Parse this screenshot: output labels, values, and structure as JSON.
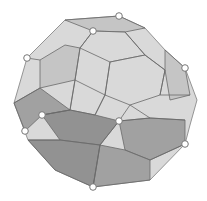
{
  "figure": {
    "colors": {
      "background": "#ffffff",
      "light_face": "#d9d9d9",
      "mid_face": "#b5b5b5",
      "dark_face": "#8e8e8e",
      "darker_face": "#7a7a7a",
      "edge": "#6a6a6a",
      "vertex_marker": "#ffffff"
    },
    "hull": [
      [
        65,
        20
      ],
      [
        119,
        16
      ],
      [
        145,
        28
      ],
      [
        165,
        50
      ],
      [
        185,
        68
      ],
      [
        197,
        100
      ],
      [
        190,
        125
      ],
      [
        185,
        144
      ],
      [
        150,
        180
      ],
      [
        93,
        187
      ],
      [
        55,
        170
      ],
      [
        28,
        140
      ],
      [
        14,
        103
      ],
      [
        27,
        58
      ]
    ],
    "upper_faces": [
      [
        [
          65,
          20
        ],
        [
          119,
          16
        ],
        [
          145,
          28
        ],
        [
          125,
          32
        ],
        [
          93,
          31
        ]
      ],
      [
        [
          93,
          31
        ],
        [
          125,
          32
        ],
        [
          145,
          55
        ],
        [
          110,
          62
        ],
        [
          80,
          48
        ]
      ],
      [
        [
          40,
          60
        ],
        [
          65,
          45
        ],
        [
          80,
          48
        ],
        [
          75,
          80
        ],
        [
          40,
          88
        ]
      ],
      [
        [
          110,
          62
        ],
        [
          145,
          55
        ],
        [
          165,
          70
        ],
        [
          160,
          95
        ],
        [
          130,
          105
        ],
        [
          105,
          95
        ]
      ],
      [
        [
          165,
          50
        ],
        [
          185,
          68
        ],
        [
          190,
          95
        ],
        [
          170,
          100
        ],
        [
          165,
          70
        ]
      ],
      [
        [
          75,
          80
        ],
        [
          105,
          95
        ],
        [
          95,
          115
        ],
        [
          70,
          110
        ]
      ]
    ],
    "lower_faces": [
      [
        [
          14,
          103
        ],
        [
          40,
          88
        ],
        [
          70,
          110
        ],
        [
          42,
          115
        ],
        [
          25,
          131
        ]
      ],
      [
        [
          42,
          115
        ],
        [
          70,
          110
        ],
        [
          95,
          115
        ],
        [
          119,
          121
        ],
        [
          100,
          145
        ],
        [
          60,
          140
        ]
      ],
      [
        [
          119,
          121
        ],
        [
          150,
          118
        ],
        [
          185,
          120
        ],
        [
          185,
          144
        ],
        [
          150,
          160
        ],
        [
          125,
          150
        ]
      ],
      [
        [
          28,
          140
        ],
        [
          60,
          140
        ],
        [
          100,
          145
        ],
        [
          93,
          187
        ],
        [
          55,
          170
        ]
      ],
      [
        [
          100,
          145
        ],
        [
          125,
          150
        ],
        [
          150,
          160
        ],
        [
          150,
          180
        ],
        [
          93,
          187
        ]
      ]
    ],
    "inner_edges": [
      [
        [
          93,
          31
        ],
        [
          80,
          48
        ]
      ],
      [
        [
          125,
          32
        ],
        [
          145,
          55
        ]
      ],
      [
        [
          80,
          48
        ],
        [
          75,
          80
        ]
      ],
      [
        [
          110,
          62
        ],
        [
          105,
          95
        ]
      ],
      [
        [
          145,
          55
        ],
        [
          165,
          70
        ]
      ],
      [
        [
          165,
          70
        ],
        [
          160,
          95
        ]
      ],
      [
        [
          75,
          80
        ],
        [
          70,
          110
        ]
      ],
      [
        [
          105,
          95
        ],
        [
          95,
          115
        ]
      ],
      [
        [
          42,
          115
        ],
        [
          70,
          110
        ]
      ],
      [
        [
          119,
          121
        ],
        [
          130,
          105
        ]
      ],
      [
        [
          119,
          121
        ],
        [
          100,
          145
        ]
      ],
      [
        [
          119,
          121
        ],
        [
          150,
          118
        ]
      ],
      [
        [
          150,
          118
        ],
        [
          185,
          120
        ]
      ],
      [
        [
          185,
          144
        ],
        [
          150,
          160
        ]
      ],
      [
        [
          100,
          145
        ],
        [
          93,
          187
        ]
      ],
      [
        [
          60,
          140
        ],
        [
          28,
          140
        ]
      ],
      [
        [
          40,
          88
        ],
        [
          14,
          103
        ]
      ],
      [
        [
          40,
          60
        ],
        [
          27,
          58
        ]
      ],
      [
        [
          160,
          95
        ],
        [
          190,
          95
        ]
      ],
      [
        [
          130,
          105
        ],
        [
          150,
          118
        ]
      ]
    ],
    "vertices": [
      {
        "x": 119,
        "y": 16
      },
      {
        "x": 93,
        "y": 31
      },
      {
        "x": 27,
        "y": 58
      },
      {
        "x": 185,
        "y": 68
      },
      {
        "x": 42,
        "y": 115
      },
      {
        "x": 119,
        "y": 121
      },
      {
        "x": 25,
        "y": 131
      },
      {
        "x": 185,
        "y": 144
      },
      {
        "x": 93,
        "y": 187
      }
    ]
  }
}
